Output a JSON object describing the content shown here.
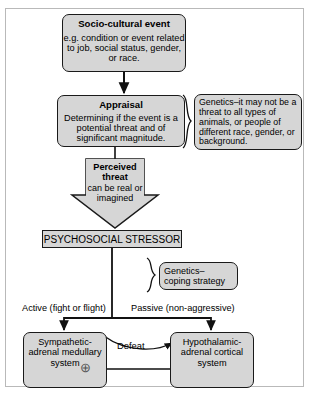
{
  "diagram": {
    "colors": {
      "node_fill": "#d6d6d6",
      "node_stroke": "#1a1a1a",
      "frame_stroke": "#b9b9b9",
      "background": "#ffffff"
    },
    "nodes": {
      "socio_cultural_event": {
        "title": "Socio-cultural event",
        "body": "e.g. condition or event related to job, social status, gender, or race."
      },
      "appraisal": {
        "title": "Appraisal",
        "body": "Determining if the event is a potential threat and of significant magnitude."
      },
      "genetics_threat": {
        "body": "Genetics–it may not be a threat to all types of animals, or people of different race, gender, or background."
      },
      "perceived_threat": {
        "title": "Perceived threat",
        "body": "can be real or imagined"
      },
      "psychosocial_stressor": {
        "title": "PSYCHOSOCIAL STRESSOR"
      },
      "genetics_coping": {
        "body": "Genetics– coping strategy"
      },
      "sympathetic_adrenal_medullary": {
        "body": "Sympathetic- adrenal medullary system"
      },
      "hypothalamic_adrenal_cortical": {
        "body": "Hypothalamic- adrenal cortical system"
      }
    },
    "labels": {
      "active_branch": "Active (fight or flight)",
      "passive_branch": "Passive (non-aggressive)",
      "defeat": "Defeat",
      "plus_sign": "⊕"
    }
  }
}
